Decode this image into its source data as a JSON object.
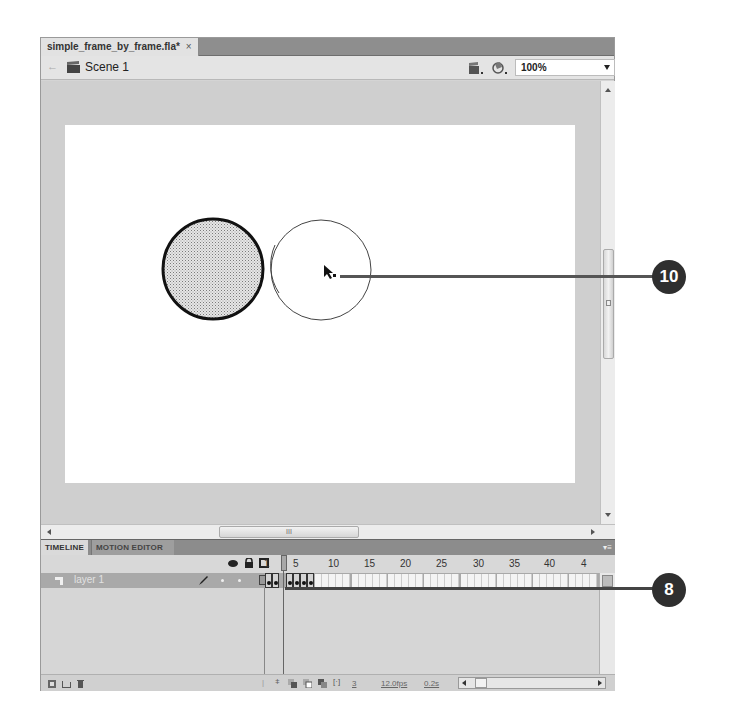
{
  "document_tab": {
    "label": "simple_frame_by_frame.fla*",
    "close": "×"
  },
  "editbar": {
    "back": "←",
    "scene_label": "Scene 1",
    "edit_symbols_icon": "edit-symbols-icon",
    "edit_scene_icon": "edit-scene-icon",
    "zoom_value": "100%"
  },
  "stage": {
    "background": "#ffffff",
    "shapes": [
      {
        "type": "ellipse",
        "role": "onion-skin-previous-frame",
        "cx": 150,
        "cy": 175,
        "r": 50,
        "fill": "dotted-gray",
        "stroke": "#111111"
      },
      {
        "type": "ellipse",
        "role": "current-frame",
        "cx": 255,
        "cy": 176,
        "r": 50,
        "fill": "none",
        "stroke": "#333333"
      }
    ],
    "cursor": "selection-arrow-icon"
  },
  "hscroll": {
    "grip": "III"
  },
  "panel": {
    "tabs": [
      {
        "label": "TIMELINE",
        "active": true
      },
      {
        "label": "MOTION EDITOR",
        "active": false
      }
    ],
    "menu_icon": "panel-menu-icon"
  },
  "timeline": {
    "header_icons": [
      "eye-icon",
      "lock-icon",
      "outline-icon"
    ],
    "frame_numbers": [
      "1",
      "5",
      "10",
      "15",
      "20",
      "25",
      "30",
      "35",
      "40",
      "4"
    ],
    "layers": [
      {
        "name": "layer 1",
        "selected": true,
        "keyframes": [
          1,
          2,
          4,
          5,
          6,
          7
        ]
      }
    ],
    "playhead_frame": 3,
    "footer": {
      "current_frame": "3",
      "fps": "12.0fps",
      "elapsed": "0.2s"
    }
  },
  "callouts": [
    {
      "number": "10",
      "target": "stage-cursor"
    },
    {
      "number": "8",
      "target": "timeline-frames"
    }
  ]
}
